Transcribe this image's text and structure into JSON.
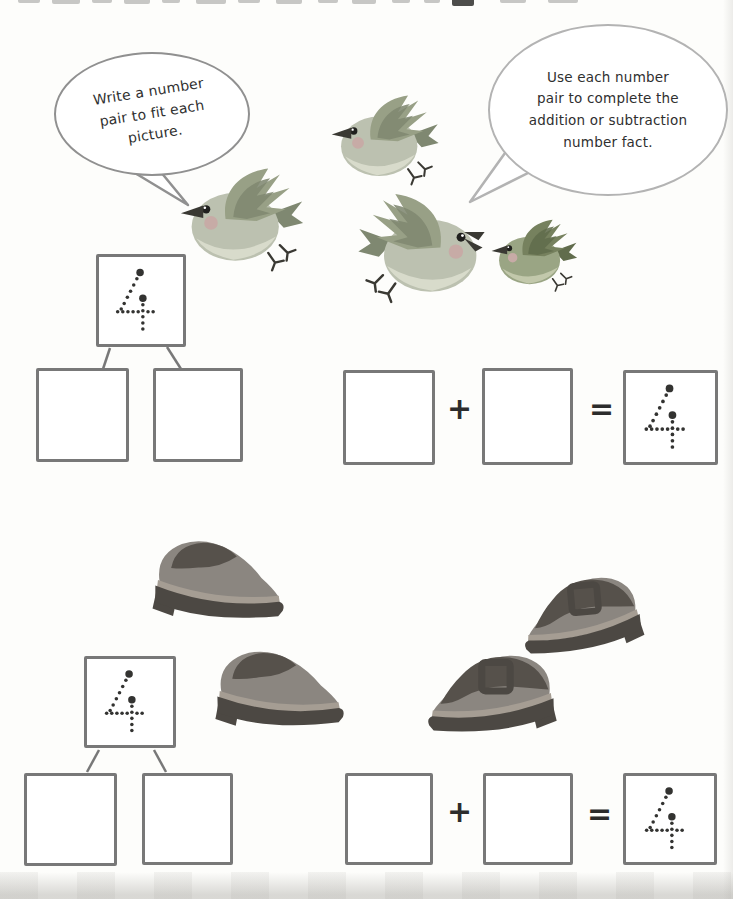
{
  "worksheet": {
    "cutoff_title_visible": true,
    "speech_bubbles": {
      "left": {
        "speaker": "bird",
        "lines": [
          "Write a number",
          "pair to fit each",
          "picture."
        ]
      },
      "right": {
        "speaker": "bird",
        "lines": [
          "Use each number",
          "pair to complete the",
          "addition or subtraction",
          "number fact."
        ]
      }
    },
    "operators": {
      "plus": "+",
      "equals": "="
    },
    "trace_numeral": "4",
    "problems": [
      {
        "illustration": "birds",
        "count": 4,
        "number_bond": {
          "total": "4",
          "parts": [
            "",
            ""
          ]
        },
        "equation": {
          "addend1": "",
          "addend2": "",
          "result": "4"
        }
      },
      {
        "illustration": "shoes",
        "count": 4,
        "number_bond": {
          "total": "4",
          "parts": [
            "",
            ""
          ]
        },
        "equation": {
          "addend1": "",
          "addend2": "",
          "result": "4"
        }
      }
    ],
    "colors": {
      "bird_wing": "#98a086",
      "bird_wing_dark": "#7f8871",
      "bird_body": "#bcc1b0",
      "bird_belly": "#d8dbcb",
      "bird_cheek": "#c7aba6",
      "bird_beak": "#3a3933",
      "bird4_wing": "#76815e",
      "bird4_wing_dark": "#616c4c",
      "bird4_body": "#9aa584",
      "bird4_belly": "#c2c8ab",
      "shoe_body": "#8b8680",
      "shoe_dark": "#56514b",
      "shoe_sole": "#4c4843",
      "shoe_sole_light": "#a59d93",
      "box_border": "#787878",
      "ink": "#2c2c2c",
      "dot_color": "#333331",
      "bubble_border": "#909090"
    }
  }
}
